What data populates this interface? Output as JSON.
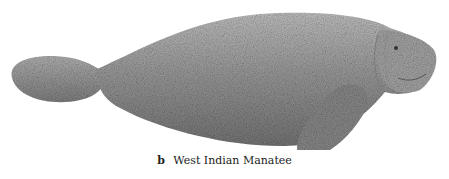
{
  "figure": {
    "caption_label": "b",
    "caption_text": "West Indian Manatee"
  },
  "colors": {
    "body_fill": "#9a9a9a",
    "body_shadow": "#6e6e6e",
    "body_highlight": "#c4c4c4",
    "background": "#ffffff"
  }
}
